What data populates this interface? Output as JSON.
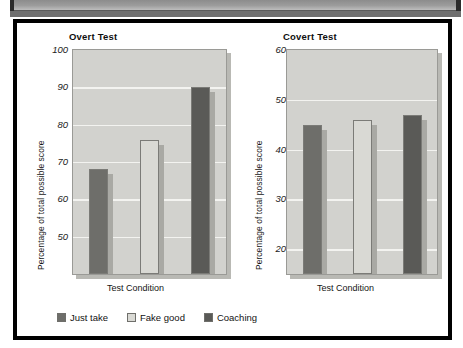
{
  "figure": {
    "scan_artifact": "page-edge-strip"
  },
  "legend": {
    "position": "bottom",
    "items": [
      {
        "label": "Just take",
        "color": "#6e6e6a"
      },
      {
        "label": "Fake good",
        "color": "#d9d9d4"
      },
      {
        "label": "Coaching",
        "color": "#5a5a57"
      }
    ]
  },
  "chart_data": [
    {
      "type": "bar",
      "title": "Overt Test",
      "xlabel": "Test Condition",
      "ylabel": "Percentage of total possible score",
      "categories": [
        "Just take",
        "Fake good",
        "Coaching"
      ],
      "values": [
        68,
        76,
        90
      ],
      "colors": [
        "#6e6e6a",
        "#d9d9d4",
        "#5a5a57"
      ],
      "ylim": [
        40,
        100
      ],
      "yticks": [
        50,
        60,
        70,
        80,
        90,
        100
      ],
      "ytick_labels": [
        "50",
        "60",
        "70",
        "80",
        "90",
        "100"
      ],
      "grid": true,
      "legend": "bottom, shared"
    },
    {
      "type": "bar",
      "title": "Covert Test",
      "xlabel": "Test  Condition",
      "ylabel": "Percentage of total possible score",
      "categories": [
        "Just take",
        "Fake good",
        "Coaching"
      ],
      "values": [
        45,
        46,
        47
      ],
      "colors": [
        "#6e6e6a",
        "#d9d9d4",
        "#5a5a57"
      ],
      "ylim": [
        15,
        60
      ],
      "yticks": [
        20,
        30,
        40,
        50,
        60
      ],
      "ytick_labels": [
        "20",
        "30",
        "40",
        "50",
        "60"
      ],
      "grid": true,
      "legend": "bottom, shared"
    }
  ]
}
